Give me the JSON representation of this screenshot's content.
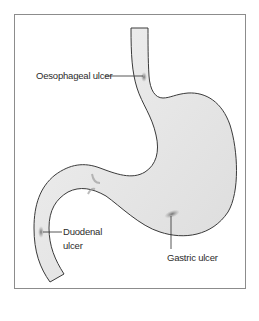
{
  "diagram": {
    "labels": {
      "oesophageal": "Oesophageal ulcer",
      "duodenal_line1": "Duodenal",
      "duodenal_line2": "ulcer",
      "gastric": "Gastric ulcer"
    },
    "colors": {
      "organ_fill": "#e6e6e6",
      "organ_outline": "#3a3a3a",
      "ulcer": "#8a8a8a",
      "frame": "#8c8c8c",
      "text": "#2b2b2b"
    }
  }
}
